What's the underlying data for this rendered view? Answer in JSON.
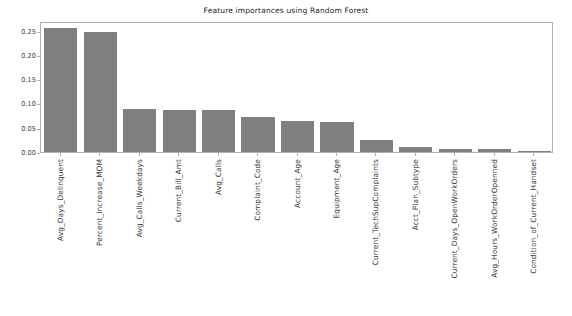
{
  "chart_data": {
    "type": "bar",
    "title": "Feature importances using Random Forest",
    "xlabel": "",
    "ylabel": "",
    "ylim": [
      0.0,
      0.27
    ],
    "grid": false,
    "legend": null,
    "bar_color": "#7f7f7f",
    "categories": [
      "Avg_Days_Delinquent",
      "Percent_Increase_MOM",
      "Avg_Calls_Weekdays",
      "Current_Bill_Amt",
      "Avg_Calls",
      "Complaint_Code",
      "Account_Age",
      "Equipment_Age",
      "Current_TechSupComplaints",
      "Acct_Plan_Subtype",
      "Current_Days_OpenWorkOrders",
      "Avg_Hours_WorkOrderOpenned",
      "Condition_of_Current_Handset"
    ],
    "values": [
      0.256,
      0.248,
      0.089,
      0.086,
      0.086,
      0.073,
      0.064,
      0.061,
      0.024,
      0.01,
      0.007,
      0.006,
      0.001
    ],
    "ytick_labels": [
      "0.00",
      "0.05",
      "0.10",
      "0.15",
      "0.20",
      "0.25"
    ],
    "ytick_values": [
      0.0,
      0.05,
      0.1,
      0.15,
      0.2,
      0.25
    ]
  }
}
